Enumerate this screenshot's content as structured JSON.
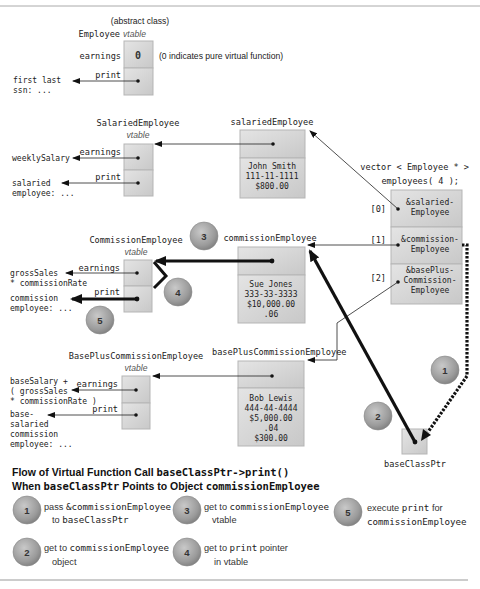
{
  "employee_vtable": {
    "title_line1": "(abstract class)",
    "class_name": "Employee",
    "suffix": "vtable",
    "earnings_label": "earnings",
    "earnings_value": "0",
    "print_label": "print",
    "note": "(0 indicates pure virtual function)",
    "print_target_line1": "first last",
    "print_target_line2": "ssn: ..."
  },
  "salaried_vtable": {
    "class_name": "SalariedEmployee",
    "suffix": "vtable",
    "earnings_label": "earnings",
    "print_label": "print",
    "earnings_target": "weeklySalary",
    "print_target_line1": "salaried",
    "print_target_line2": "employee: ..."
  },
  "salaried_object": {
    "name": "salariedEmployee",
    "fields": [
      "John Smith",
      "111-11-1111",
      "$800.00"
    ]
  },
  "commission_vtable": {
    "class_name": "CommissionEmployee",
    "suffix": "vtable",
    "earnings_label": "earnings",
    "print_label": "print",
    "earnings_target_line1": "grossSales",
    "earnings_target_line2": "* commissionRate",
    "print_target_line1": "commission",
    "print_target_line2": "employee: ..."
  },
  "commission_object": {
    "name": "commissionEmployee",
    "fields": [
      "Sue Jones",
      "333-33-3333",
      "$10,000.00",
      ".06"
    ]
  },
  "baseplus_vtable": {
    "class_name": "BasePlusCommissionEmployee",
    "suffix": "vtable",
    "earnings_label": "earnings",
    "print_label": "print",
    "earnings_target_lines": [
      "baseSalary +",
      "( grossSales",
      "* commissionRate )"
    ],
    "print_target_lines": [
      "base-",
      "salaried",
      "commission",
      "employee: ..."
    ]
  },
  "baseplus_object": {
    "name": "basePlusCommissionEmployee",
    "fields": [
      "Bob Lewis",
      "444-44-4444",
      "$5,000.00",
      ".04",
      "$300.00"
    ]
  },
  "vector": {
    "decl_line1": "vector < Employee * >",
    "decl_line2": "employees( 4 );",
    "elements": [
      {
        "index": "[0]",
        "line1": "&salaried-",
        "line2": "Employee",
        "line3": ""
      },
      {
        "index": "[1]",
        "line1": "&commission-",
        "line2": "Employee",
        "line3": ""
      },
      {
        "index": "[2]",
        "line1": "&basePlus-",
        "line2": "Commission-",
        "line3": "Employee"
      }
    ]
  },
  "pointer": {
    "name": "baseClassPtr"
  },
  "step_markers": {
    "s1": "1",
    "s2": "2",
    "s3": "3",
    "s4": "4",
    "s5": "5"
  },
  "caption": {
    "line1_text": "Flow of Virtual Function Call ",
    "line1_code": "baseClassPtr->print()",
    "line2_text1": "When ",
    "line2_code1": "baseClassPtr",
    "line2_text2": " Points to Object ",
    "line2_code2": "commissionEmployee"
  },
  "legend": [
    {
      "num": "1",
      "text1": "pass ",
      "code1": "&commissionEmployee",
      "text2": "to ",
      "code2": "baseClassPtr"
    },
    {
      "num": "2",
      "text1": "get to ",
      "code1": "commissionEmployee",
      "text2": "object",
      "code2": ""
    },
    {
      "num": "3",
      "text1": "get to ",
      "code1": "commissionEmployee",
      "text2": "vtable",
      "code2": ""
    },
    {
      "num": "4",
      "text1": "get to ",
      "code1": "print",
      "text1b": " pointer",
      "text2": "in vtable",
      "code2": ""
    },
    {
      "num": "5",
      "text1": "execute ",
      "code1": "print",
      "text1b": " for",
      "text2": "",
      "code2": "commissionEmployee"
    }
  ],
  "colors": {
    "cell_fill": "#d4d4d4",
    "cell_border": "#b8b8b8",
    "circle_fill": "#9a9a9a",
    "line": "#111111",
    "rule": "#999999"
  }
}
